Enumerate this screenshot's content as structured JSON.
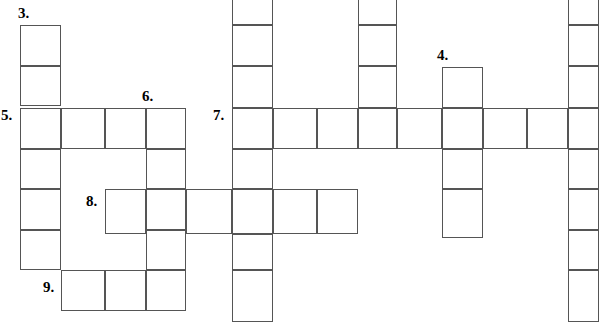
{
  "puzzle": {
    "type": "crossword-grid",
    "title": "Crossword puzzle grid",
    "width": 599,
    "height": 322,
    "cell_size": 40.5,
    "grid_line_color": "#555555",
    "cell_fill_color": "#ffffff",
    "background_color": "#ffffff",
    "number_color": "#000000",
    "clue_numbers": [
      {
        "label": "3.",
        "x": 18,
        "y": 6
      },
      {
        "label": "4.",
        "x": 437,
        "y": 48
      },
      {
        "label": "5.",
        "x": 1,
        "y": 108
      },
      {
        "label": "6.",
        "x": 142,
        "y": 89
      },
      {
        "label": "7.",
        "x": 213,
        "y": 108
      },
      {
        "label": "8.",
        "x": 86,
        "y": 194
      },
      {
        "label": "9.",
        "x": 43,
        "y": 280
      }
    ],
    "cells": [
      {
        "name": "cell-r1c0",
        "x": 20,
        "y": 25,
        "w": 40.5,
        "h": 40.5
      },
      {
        "name": "cell-r2c0",
        "x": 20,
        "y": 65.5,
        "w": 40.5,
        "h": 40.5
      },
      {
        "name": "cell-r3c0",
        "x": 20,
        "y": 108,
        "w": 40.5,
        "h": 40.5
      },
      {
        "name": "cell-r4c0",
        "x": 20,
        "y": 148.5,
        "w": 40.5,
        "h": 40.5
      },
      {
        "name": "cell-r5c0",
        "x": 20,
        "y": 189,
        "w": 40.5,
        "h": 40.5
      },
      {
        "name": "cell-r6c0",
        "x": 20,
        "y": 229.5,
        "w": 40.5,
        "h": 40.5
      },
      {
        "name": "cell-r3c1",
        "x": 60.5,
        "y": 108,
        "w": 44.5,
        "h": 40.5
      },
      {
        "name": "cell-r3c2",
        "x": 105,
        "y": 108,
        "w": 40.5,
        "h": 40.5
      },
      {
        "name": "cell-r3c3",
        "x": 145.5,
        "y": 108,
        "w": 40.5,
        "h": 40.5
      },
      {
        "name": "cell-r4c3",
        "x": 145.5,
        "y": 148.5,
        "w": 40.5,
        "h": 40.5
      },
      {
        "name": "cell-r5c3",
        "x": 145.5,
        "y": 189,
        "w": 40.5,
        "h": 40.5
      },
      {
        "name": "cell-r6c3",
        "x": 145.5,
        "y": 229.5,
        "w": 40.5,
        "h": 40.5
      },
      {
        "name": "cell-r7c3",
        "x": 145.5,
        "y": 270,
        "w": 40.5,
        "h": 40.5
      },
      {
        "name": "cell-r7c1",
        "x": 60.5,
        "y": 270,
        "w": 44.5,
        "h": 40.5
      },
      {
        "name": "cell-r7c2",
        "x": 105,
        "y": 270,
        "w": 40.5,
        "h": 40.5
      },
      {
        "name": "cell-r5c2",
        "x": 105,
        "y": 189,
        "w": 40.5,
        "h": 44.5
      },
      {
        "name": "cell-r5c4",
        "x": 186,
        "y": 189,
        "w": 46,
        "h": 44.5
      },
      {
        "name": "cell-r5c5",
        "x": 232,
        "y": 189,
        "w": 40.5,
        "h": 44.5
      },
      {
        "name": "cell-r5c6",
        "x": 272.5,
        "y": 189,
        "w": 44.5,
        "h": 44.5
      },
      {
        "name": "cell-r5c7",
        "x": 317,
        "y": 189,
        "w": 40.5,
        "h": 44.5
      },
      {
        "name": "cell-r0c5",
        "x": 232,
        "y": -16,
        "w": 40.5,
        "h": 41
      },
      {
        "name": "cell-r1c5",
        "x": 232,
        "y": 25,
        "w": 40.5,
        "h": 40.5
      },
      {
        "name": "cell-r2c5",
        "x": 232,
        "y": 65.5,
        "w": 40.5,
        "h": 42.5
      },
      {
        "name": "cell-r3c5",
        "x": 232,
        "y": 108,
        "w": 40.5,
        "h": 40.5
      },
      {
        "name": "cell-r4c5",
        "x": 232,
        "y": 148.5,
        "w": 40.5,
        "h": 40.5
      },
      {
        "name": "cell-r6c5",
        "x": 232,
        "y": 233.5,
        "w": 40.5,
        "h": 36.5
      },
      {
        "name": "cell-r7c5",
        "x": 232,
        "y": 270,
        "w": 40.5,
        "h": 52
      },
      {
        "name": "cell-r3c6",
        "x": 272.5,
        "y": 108,
        "w": 44.5,
        "h": 40.5
      },
      {
        "name": "cell-r3c7",
        "x": 317,
        "y": 108,
        "w": 40.5,
        "h": 40.5
      },
      {
        "name": "cell-r3c8",
        "x": 357.5,
        "y": 108,
        "w": 39.5,
        "h": 40.5
      },
      {
        "name": "cell-r3c9",
        "x": 397,
        "y": 108,
        "w": 45,
        "h": 40.5
      },
      {
        "name": "cell-r3c10",
        "x": 442,
        "y": 108,
        "w": 40.5,
        "h": 40.5
      },
      {
        "name": "cell-r3c11",
        "x": 482.5,
        "y": 108,
        "w": 44.5,
        "h": 40.5
      },
      {
        "name": "cell-r3c12",
        "x": 527,
        "y": 108,
        "w": 41,
        "h": 40.5
      },
      {
        "name": "cell-r3c13",
        "x": 568,
        "y": 108,
        "w": 31,
        "h": 40.5
      },
      {
        "name": "cell-r0c8",
        "x": 357.5,
        "y": -16,
        "w": 39.5,
        "h": 41
      },
      {
        "name": "cell-r1c8",
        "x": 357.5,
        "y": 25,
        "w": 39.5,
        "h": 40.5
      },
      {
        "name": "cell-r2c8",
        "x": 357.5,
        "y": 65.5,
        "w": 39.5,
        "h": 42.5
      },
      {
        "name": "cell-r2c10",
        "x": 442,
        "y": 67,
        "w": 40.5,
        "h": 41
      },
      {
        "name": "cell-r4c10",
        "x": 442,
        "y": 148.5,
        "w": 40.5,
        "h": 40.5
      },
      {
        "name": "cell-r5c10",
        "x": 442,
        "y": 189,
        "w": 40.5,
        "h": 48.5
      },
      {
        "name": "cell-r0c13",
        "x": 568,
        "y": -16,
        "w": 31,
        "h": 41
      },
      {
        "name": "cell-r1c13",
        "x": 568,
        "y": 25,
        "w": 31,
        "h": 40.5
      },
      {
        "name": "cell-r2c13",
        "x": 568,
        "y": 65.5,
        "w": 31,
        "h": 42.5
      },
      {
        "name": "cell-r4c13",
        "x": 568,
        "y": 148.5,
        "w": 31,
        "h": 40.5
      },
      {
        "name": "cell-r5c13",
        "x": 568,
        "y": 189,
        "w": 31,
        "h": 40.5
      },
      {
        "name": "cell-r6c13",
        "x": 568,
        "y": 229.5,
        "w": 31,
        "h": 40.5
      },
      {
        "name": "cell-r7c13",
        "x": 568,
        "y": 270,
        "w": 31,
        "h": 52
      }
    ]
  }
}
